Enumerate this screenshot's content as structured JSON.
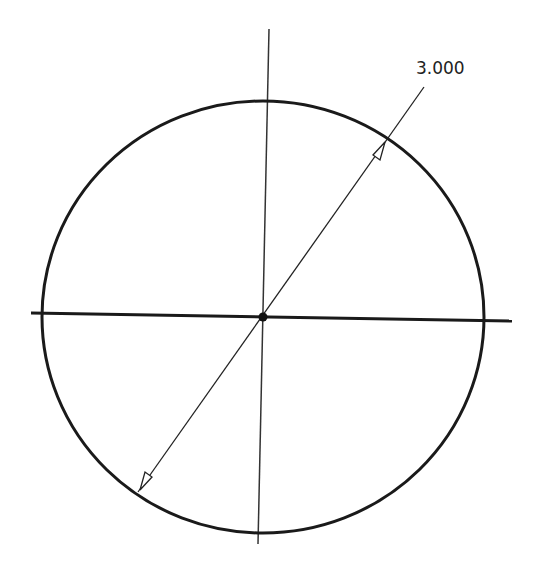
{
  "sketch": {
    "circle": {
      "cx": 263,
      "cy": 317,
      "rx": 221,
      "ry": 216,
      "stroke": "#1a1a1a"
    },
    "center_point": {
      "x": 263,
      "y": 317
    },
    "horizontal_axis": {
      "x1": 31,
      "y1": 313,
      "x2": 512,
      "y2": 321
    },
    "vertical_axis": {
      "x1": 269,
      "y1": 29,
      "x2": 258,
      "y2": 544
    },
    "diameter_dimension": {
      "value": "3.000",
      "line": {
        "x1": 138,
        "y1": 492,
        "x2": 424,
        "y2": 87
      },
      "arrow_a": {
        "x": 140,
        "y": 490
      },
      "arrow_b": {
        "x": 385,
        "y": 142
      },
      "label_pos": {
        "x": 427,
        "y": 70
      }
    }
  }
}
